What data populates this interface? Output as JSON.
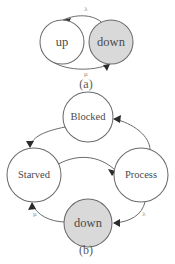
{
  "figure": {
    "background_color": "#ffffff",
    "stroke_color": "#6b6b6b",
    "shaded_fill": "#d9d9d9",
    "label_color": "#4a4a4a",
    "arrow_color": "#2b2b2b"
  },
  "panel_a": {
    "caption": "(a)",
    "nodes": [
      {
        "id": "up",
        "label": "up",
        "shaded": false,
        "cx": 62,
        "cy": 42,
        "r": 22
      },
      {
        "id": "down",
        "label": "down",
        "shaded": true,
        "cx": 111,
        "cy": 42,
        "r": 22
      }
    ],
    "edges": [
      {
        "id": "up-to-down-top",
        "from": "up",
        "to": "down",
        "label": "λ",
        "label_x": 86,
        "label_y": 9
      },
      {
        "id": "down-to-up-bottom",
        "from": "down",
        "to": "up",
        "label": "μ",
        "label_x": 86,
        "label_y": 74
      }
    ]
  },
  "panel_b": {
    "caption": "(b)",
    "nodes": [
      {
        "id": "blocked",
        "label": "Blocked",
        "shaded": false,
        "cx": 88,
        "cy": 117,
        "r": 25
      },
      {
        "id": "starved",
        "label": "Starved",
        "shaded": false,
        "cx": 34,
        "cy": 175,
        "r": 27
      },
      {
        "id": "process",
        "label": "Process",
        "shaded": false,
        "cx": 141,
        "cy": 175,
        "r": 27
      },
      {
        "id": "down",
        "label": "down",
        "shaded": true,
        "cx": 88,
        "cy": 223,
        "r": 24
      }
    ],
    "edges": [
      {
        "id": "blocked-to-starved",
        "from": "blocked",
        "to": "starved",
        "label": ""
      },
      {
        "id": "process-to-blocked",
        "from": "process",
        "to": "blocked",
        "label": ""
      },
      {
        "id": "starved-to-process",
        "from": "starved",
        "to": "process",
        "label": ""
      },
      {
        "id": "down-to-starved",
        "from": "down",
        "to": "starved",
        "label": "μ",
        "label_x": 35,
        "label_y": 213
      },
      {
        "id": "process-to-down",
        "from": "process",
        "to": "down",
        "label": "λ",
        "label_x": 143,
        "label_y": 213
      }
    ]
  }
}
